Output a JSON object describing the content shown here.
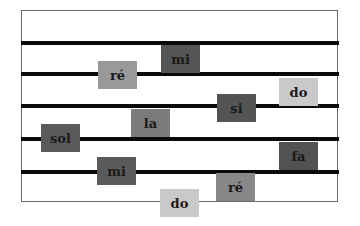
{
  "diagram": {
    "type": "music-staff",
    "line_count": 5,
    "colors": {
      "frame": "#6a6a6a",
      "line": "#0a0a0a",
      "note_text": "#1a1a1a"
    },
    "staff_lines_y": [
      41,
      72,
      104,
      137,
      170
    ],
    "notes": [
      {
        "label": "mi",
        "x": 161,
        "y": 45,
        "color": "#555555"
      },
      {
        "label": "ré",
        "x": 98,
        "y": 61,
        "color": "#999999"
      },
      {
        "label": "do",
        "x": 279,
        "y": 78,
        "color": "#c9c9c9"
      },
      {
        "label": "si",
        "x": 217,
        "y": 94,
        "color": "#545454"
      },
      {
        "label": "la",
        "x": 131,
        "y": 109,
        "color": "#7b7b7b"
      },
      {
        "label": "sol",
        "x": 41,
        "y": 124,
        "color": "#5a5a5a"
      },
      {
        "label": "fa",
        "x": 279,
        "y": 142,
        "color": "#525252"
      },
      {
        "label": "mi",
        "x": 97,
        "y": 157,
        "color": "#5a5a5a"
      },
      {
        "label": "ré",
        "x": 216,
        "y": 173,
        "color": "#888888"
      },
      {
        "label": "do",
        "x": 160,
        "y": 189,
        "color": "#c9c9c9"
      }
    ]
  }
}
